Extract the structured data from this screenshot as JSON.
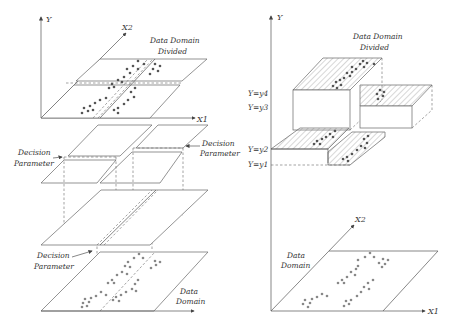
{
  "left_panel": {
    "axes": {
      "y": "Y",
      "x1": "X1",
      "x2": "X2"
    },
    "labels": {
      "divided_line1": "Data Domain",
      "divided_line2": "Divided",
      "decision_left_1": "Decision",
      "decision_left_2": "Parameter",
      "decision_right_1": "Decision",
      "decision_right_2": "Parameter",
      "decision_bottom_1": "Decision",
      "decision_bottom_2": "Parameter",
      "domain_line1": "Data",
      "domain_line2": "Domain"
    }
  },
  "right_panel": {
    "axes": {
      "y": "Y",
      "x1": "X1",
      "x2": "X2"
    },
    "levels": [
      "Y=y4",
      "Y=y3",
      "Y=y2",
      "Y=y1"
    ],
    "labels": {
      "divided_line1": "Data Domain",
      "divided_line2": "Divided",
      "domain_line1": "Data",
      "domain_line2": "Domain"
    }
  },
  "colors": {
    "line": "#555555",
    "dots_dark": "#555555",
    "dots_grey": "#888888",
    "background": "#ffffff"
  }
}
